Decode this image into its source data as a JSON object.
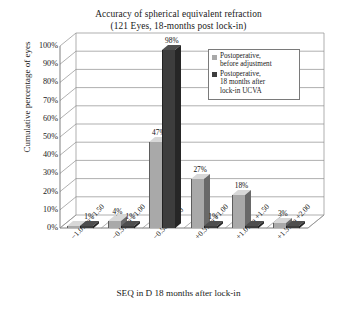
{
  "chart_data": {
    "type": "bar",
    "title": "Accuracy of spherical equivalent refraction",
    "subtitle": "(121 Eyes, 18-months post lock-in)",
    "xlabel": "SEQ in D 18 months after lock-in",
    "ylabel": "Cumulative percentage of eyes",
    "ylim": [
      0,
      100
    ],
    "ytick_labels": [
      "0%",
      "10%",
      "20%",
      "30%",
      "40%",
      "50%",
      "60%",
      "70%",
      "80%",
      "90%",
      "100%"
    ],
    "ytick_values": [
      0,
      10,
      20,
      30,
      40,
      50,
      60,
      70,
      80,
      90,
      100
    ],
    "grid": true,
    "legend_position": "top-right",
    "categories": [
      "−1.01 to −1.50",
      "−0.51 to −1.00",
      "−0.50 to 0.50",
      "+0.51 to +1.00",
      "+1.01 to +1.50",
      "+1.51 to +2.00"
    ],
    "series": [
      {
        "name": "Postoperative, before adjustment",
        "color": "#a9a9a9",
        "values": [
          0,
          4,
          47,
          27,
          18,
          3
        ],
        "labels": [
          "",
          "4%",
          "47%",
          "27%",
          "18%",
          "3%"
        ]
      },
      {
        "name": "Postoperative, 18 months after lock-in UCVA",
        "color": "#3d3d3d",
        "values": [
          1,
          1,
          98,
          1,
          0,
          0
        ],
        "labels": [
          "1%",
          "1%",
          "98%",
          "1%",
          "",
          ""
        ]
      }
    ]
  },
  "legend": {
    "entries": [
      {
        "label_line1": "Postoperative,",
        "label_line2": "before adjustment",
        "label_line3": "",
        "color": "#a9a9a9"
      },
      {
        "label_line1": "Postoperative,",
        "label_line2": "18 months after",
        "label_line3": "lock-in UCVA",
        "color": "#3d3d3d"
      }
    ]
  }
}
